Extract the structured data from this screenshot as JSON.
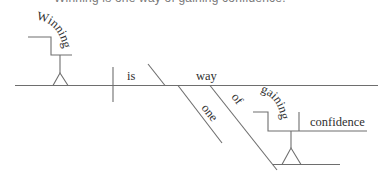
{
  "caption": "Winning is one way of gaining confidence.",
  "diagram": {
    "type": "reed-kellogg-sentence-diagram",
    "colors": {
      "line": "#6e6e6e",
      "text": "#2f2f2f",
      "caption": "#7a7a7a"
    },
    "words": {
      "subject": "Winning",
      "verb": "is",
      "predicate_nominative": "way",
      "adjective": "one",
      "preposition": "of",
      "gerund": "gaining",
      "gerund_object": "confidence"
    },
    "roles": {
      "subject": "gerund phrase on stilt (subject)",
      "verb": "linking verb",
      "predicate_nominative": "subject complement",
      "adjective": "modifier of way",
      "preposition": "prepositional phrase modifying way",
      "gerund": "object of preposition (gerund)",
      "gerund_object": "direct object of gaining"
    }
  }
}
